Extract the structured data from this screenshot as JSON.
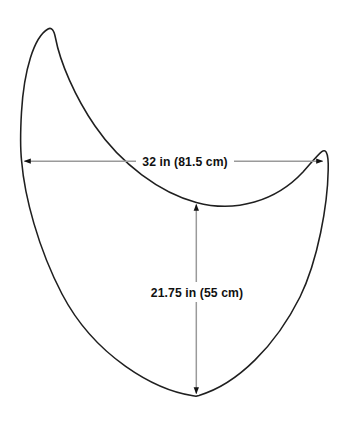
{
  "diagram": {
    "type": "dimensioned-shape",
    "background_color": "#ffffff",
    "outline_color": "#1f1f1f",
    "dimension_line_color": "#9a9a9a",
    "arrowhead_color": "#111111",
    "label_color": "#111111",
    "shape": {
      "name": "crescent-bib-outline",
      "left_horn_tip": [
        48,
        29
      ],
      "right_horn_tip": [
        326,
        152
      ],
      "bottom_vertex": [
        196,
        396
      ],
      "inner_arc_low_point": [
        196,
        202
      ]
    },
    "dimensions": [
      {
        "name": "width-dimension",
        "orientation": "horizontal",
        "label": "32 in (81.5 cm)",
        "value_in": 32,
        "value_cm": 81.5,
        "unit_primary": "in",
        "unit_secondary": "cm",
        "y": 161,
        "x_start": 22,
        "x_end": 325,
        "label_center_x": 185,
        "label_center_y": 161
      },
      {
        "name": "height-dimension",
        "orientation": "vertical",
        "label": "21.75 in (55 cm)",
        "value_in": 21.75,
        "value_cm": 55,
        "unit_primary": "in",
        "unit_secondary": "cm",
        "x": 196,
        "y_start": 202,
        "y_end": 396,
        "label_center_x": 197,
        "label_center_y": 292
      }
    ]
  }
}
